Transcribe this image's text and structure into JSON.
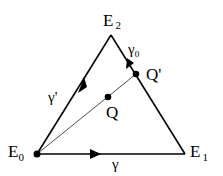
{
  "diagram": {
    "vertices": {
      "E0": {
        "label": "E",
        "sub": "0"
      },
      "E1": {
        "label": "E",
        "sub": "1"
      },
      "E2": {
        "label": "E",
        "sub": "2"
      }
    },
    "points": {
      "Q": {
        "label": "Q"
      },
      "Qp": {
        "label": "Q'"
      }
    },
    "paths": {
      "gamma": {
        "label": "γ"
      },
      "gamma_prime": {
        "label": "γ'"
      },
      "gamma_0": {
        "label": "γ",
        "sub": "0"
      }
    },
    "colors": {
      "stroke": "#000000",
      "background": "#ffffff"
    }
  }
}
